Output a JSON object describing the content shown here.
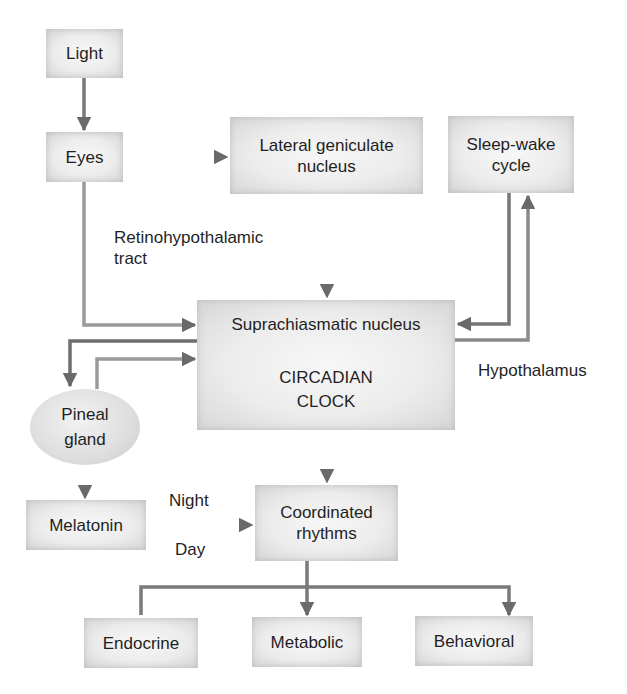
{
  "diagram": {
    "colors": {
      "arrow_dark": "#6a6a6a",
      "arrow_light": "#a8a8a8",
      "box_fill": "#ececec",
      "text": "#1f1f1f"
    },
    "nodes": {
      "light": {
        "label": "Light"
      },
      "eyes": {
        "label": "Eyes"
      },
      "lgn": {
        "line1": "Lateral geniculate",
        "line2": "nucleus"
      },
      "sleep_wake": {
        "line1": "Sleep-wake",
        "line2": "cycle"
      },
      "scn": {
        "title": "Suprachiasmatic nucleus",
        "line1": "CIRCADIAN",
        "line2": "CLOCK"
      },
      "pineal": {
        "line1": "Pineal",
        "line2": "gland"
      },
      "melatonin": {
        "label": "Melatonin"
      },
      "coordinated": {
        "line1": "Coordinated",
        "line2": "rhythms"
      },
      "endocrine": {
        "label": "Endocrine"
      },
      "metabolic": {
        "label": "Metabolic"
      },
      "behavioral": {
        "label": "Behavioral"
      }
    },
    "edge_labels": {
      "retino_line1": "Retinohypothalamic",
      "retino_line2": "tract",
      "hypothalamus": "Hypothalamus",
      "night": "Night",
      "day": "Day"
    },
    "edges": [
      {
        "from": "Light",
        "to": "Eyes"
      },
      {
        "from": "Eyes",
        "to": "Lateral geniculate nucleus"
      },
      {
        "from": "Eyes",
        "to": "Suprachiasmatic nucleus",
        "label": "Retinohypothalamic tract"
      },
      {
        "from": "Lateral geniculate nucleus",
        "to": "Suprachiasmatic nucleus"
      },
      {
        "from": "Sleep-wake cycle",
        "to": "Suprachiasmatic nucleus"
      },
      {
        "from": "Suprachiasmatic nucleus",
        "to": "Sleep-wake cycle",
        "label": "Hypothalamus"
      },
      {
        "from": "Suprachiasmatic nucleus",
        "to": "Pineal gland"
      },
      {
        "from": "Pineal gland",
        "to": "Suprachiasmatic nucleus"
      },
      {
        "from": "Pineal gland",
        "to": "Melatonin"
      },
      {
        "from": "Melatonin",
        "to": "Coordinated rhythms",
        "labels": [
          "Night",
          "Day"
        ]
      },
      {
        "from": "Suprachiasmatic nucleus",
        "to": "Coordinated rhythms"
      },
      {
        "from": "Coordinated rhythms",
        "to": "Endocrine"
      },
      {
        "from": "Coordinated rhythms",
        "to": "Metabolic"
      },
      {
        "from": "Coordinated rhythms",
        "to": "Behavioral"
      }
    ]
  }
}
